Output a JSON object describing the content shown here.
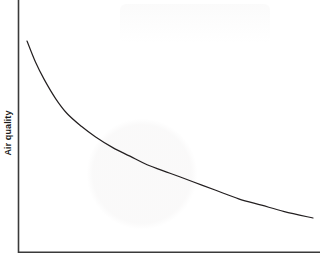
{
  "chart_data": {
    "type": "line",
    "title": "",
    "subtitle": "",
    "xlabel": "",
    "ylabel": "Air quality",
    "legend": [],
    "annotations": [],
    "grid": false,
    "xticks": [],
    "yticks": [],
    "xtick_labels": [],
    "ytick_labels": [],
    "xlim": [
      0,
      100
    ],
    "ylim": [
      0,
      100
    ],
    "series": [
      {
        "name": "Air quality",
        "color": "#231f20",
        "linewidth": 1.2,
        "x": [
          0,
          3,
          6,
          10,
          14,
          19,
          24,
          30,
          36,
          42,
          50,
          58,
          66,
          74,
          82,
          90,
          100
        ],
        "y": [
          100,
          90,
          82,
          73,
          66,
          60,
          55,
          50,
          46,
          42,
          38,
          34,
          30,
          26,
          23,
          20,
          17
        ]
      }
    ]
  },
  "axes": {
    "y_axis_label": "Air quality",
    "y_axis_name": "y-axis-line",
    "x_axis_name": "x-axis-line",
    "axis_color": "#3a3a3a"
  },
  "colors": {
    "background": "#ffffff",
    "curve": "#231f20",
    "axis": "#3a3a3a",
    "text": "#1a1a1a"
  }
}
